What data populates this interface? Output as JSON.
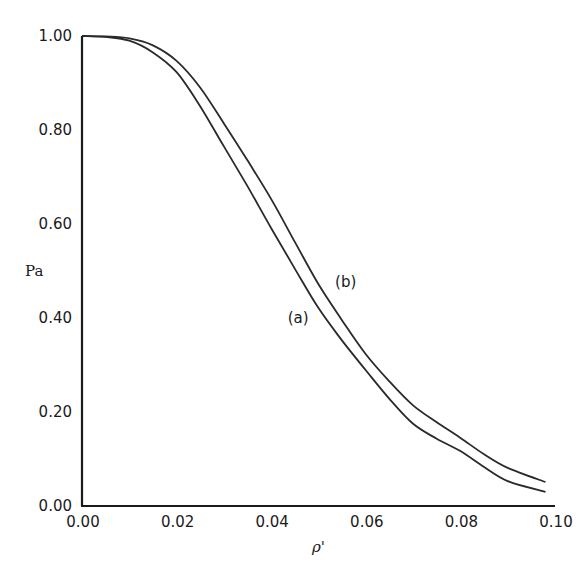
{
  "chart_data": {
    "type": "line",
    "title": "",
    "xlabel": "ρ'",
    "ylabel": "Pa",
    "xlim": [
      0.0,
      0.1
    ],
    "ylim": [
      0.0,
      1.0
    ],
    "grid": false,
    "legend": "inline labels",
    "x_ticks": [
      "0.00",
      "0.02",
      "0.04",
      "0.06",
      "0.08",
      "0.10"
    ],
    "y_ticks": [
      "0.00",
      "0.20",
      "0.40",
      "0.60",
      "0.80",
      "1.00"
    ],
    "x_tick_values": [
      0.0,
      0.02,
      0.04,
      0.06,
      0.08,
      0.1
    ],
    "y_tick_values": [
      0.0,
      0.2,
      0.4,
      0.6,
      0.8,
      1.0
    ],
    "x": [
      0.0,
      0.005,
      0.01,
      0.015,
      0.02,
      0.025,
      0.03,
      0.035,
      0.04,
      0.045,
      0.05,
      0.055,
      0.06,
      0.065,
      0.07,
      0.075,
      0.08,
      0.085,
      0.09,
      0.098
    ],
    "series": [
      {
        "name": "(a)",
        "label": "(a)",
        "values": [
          1.0,
          0.998,
          0.99,
          0.965,
          0.923,
          0.85,
          0.765,
          0.68,
          0.591,
          0.505,
          0.421,
          0.352,
          0.289,
          0.228,
          0.175,
          0.143,
          0.117,
          0.083,
          0.053,
          0.03
        ],
        "label_pos": [
          0.0435,
          0.39
        ]
      },
      {
        "name": "(b)",
        "label": "(b)",
        "values": [
          1.0,
          0.999,
          0.995,
          0.98,
          0.947,
          0.89,
          0.814,
          0.735,
          0.653,
          0.562,
          0.472,
          0.395,
          0.323,
          0.265,
          0.214,
          0.178,
          0.145,
          0.11,
          0.081,
          0.051
        ],
        "label_pos": [
          0.0535,
          0.465
        ]
      }
    ]
  }
}
